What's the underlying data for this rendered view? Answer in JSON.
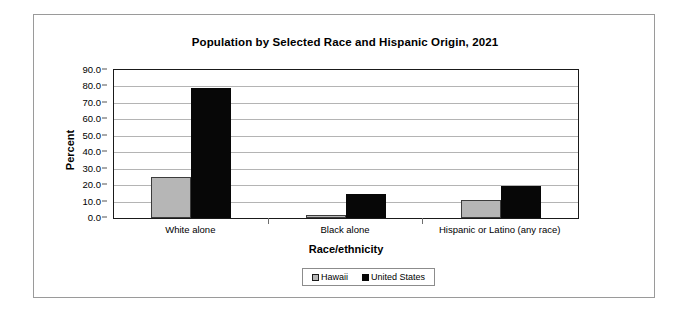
{
  "chart_data": {
    "type": "bar",
    "title": "Population by Selected Race and Hispanic Origin, 2021",
    "xlabel": "Race/ethnicity",
    "ylabel": "Percent",
    "categories": [
      "White alone",
      "Black alone",
      "Hispanic or Latino (any race)"
    ],
    "series": [
      {
        "name": "Hawaii",
        "color": "#b6b6b6",
        "values": [
          25.0,
          2.0,
          11.0
        ]
      },
      {
        "name": "United States",
        "color": "#070707",
        "values": [
          79.0,
          14.5,
          19.5
        ]
      }
    ],
    "ylim": [
      0.0,
      90.0
    ],
    "ytick_labels": [
      "0.0",
      "10.0",
      "20.0",
      "30.0",
      "40.0",
      "50.0",
      "60.0",
      "70.0",
      "80.0",
      "90.0"
    ],
    "ytick_values": [
      0.0,
      10.0,
      20.0,
      30.0,
      40.0,
      50.0,
      60.0,
      70.0,
      80.0,
      90.0
    ],
    "grid": true,
    "legend_position": "bottom"
  }
}
